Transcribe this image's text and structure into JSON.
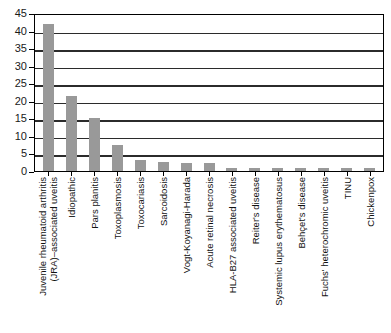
{
  "chart_data": {
    "type": "bar",
    "title": "",
    "subtitle": "",
    "xlabel": "",
    "ylabel": "",
    "ylim": [
      0,
      45
    ],
    "ytick_step": 5,
    "yticks": [
      45,
      40,
      35,
      30,
      25,
      20,
      15,
      10,
      5,
      0
    ],
    "grid": true,
    "legend": false,
    "bar_color": "#999999",
    "axis_color": "#000000",
    "categories": [
      "Juvenile rheumatoid arthritis (JRA)–associated uveitis",
      "Idiopathic",
      "Pars planitis",
      "Toxoplasmosis",
      "Toxocariasis",
      "Sarcoidosis",
      "Vogt-Koyanagi-Harada",
      "Acute retinal necrosis",
      "HLA-B27 associated uveitis",
      "Reiter's disease",
      "Systemic lupus erythematosus",
      "Behçet's disease",
      "Fuchs' heterochromic uveitis",
      "TINU",
      "Chickenpox"
    ],
    "category_lines": [
      [
        "Juvenile rheumatoid arthritis",
        "(JRA)–associated uveitis"
      ],
      [
        "Idiopathic",
        ""
      ],
      [
        "Pars planitis",
        ""
      ],
      [
        "Toxoplasmosis",
        ""
      ],
      [
        "Toxocariasis",
        ""
      ],
      [
        "Sarcoidosis",
        ""
      ],
      [
        "Vogt-Koyanagi-Harada",
        ""
      ],
      [
        "Acute retinal necrosis",
        ""
      ],
      [
        "HLA-B27 associated uveitis",
        ""
      ],
      [
        "Reiter's disease",
        ""
      ],
      [
        "Systemic lupus erythematosus",
        ""
      ],
      [
        "Behçet's disease",
        ""
      ],
      [
        "Fuchs' heterochromic uveitis",
        ""
      ],
      [
        "TINU",
        ""
      ],
      [
        "Chickenpox",
        ""
      ]
    ],
    "values": [
      42,
      21.5,
      15,
      7.3,
      3,
      2.5,
      2.2,
      2.2,
      1,
      1,
      1,
      1,
      1,
      1,
      1
    ]
  }
}
